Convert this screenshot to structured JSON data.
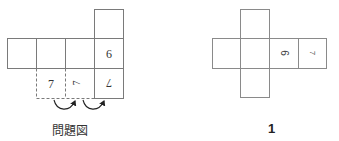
{
  "figures": {
    "problem": {
      "caption": "問題図",
      "cells": [
        {
          "id": "row-1",
          "x": 7,
          "y": 38,
          "label": ""
        },
        {
          "id": "row-2",
          "x": 36,
          "y": 38,
          "label": ""
        },
        {
          "id": "row-3",
          "x": 65,
          "y": 38,
          "label": ""
        },
        {
          "id": "row-4",
          "x": 94,
          "y": 38,
          "label": "6",
          "rotation": 0
        },
        {
          "id": "top",
          "x": 94,
          "y": 9,
          "label": ""
        },
        {
          "id": "bottom-solid",
          "x": 94,
          "y": 68,
          "label": "7",
          "rotation": 180
        }
      ],
      "dashed_cells": [
        {
          "id": "dashed-1",
          "x": 36,
          "y": 68,
          "label": "7",
          "rotation": 0
        },
        {
          "id": "dashed-2",
          "x": 65,
          "y": 68,
          "label": "7",
          "rotation": -90
        }
      ],
      "arrows": [
        {
          "from": "dashed-1",
          "to": "dashed-2"
        },
        {
          "from": "dashed-2",
          "to": "bottom-solid"
        }
      ]
    },
    "option1": {
      "caption": "1",
      "cells": [
        {
          "id": "top",
          "x": 240,
          "y": 9,
          "label": ""
        },
        {
          "id": "row-1",
          "x": 212,
          "y": 38,
          "label": ""
        },
        {
          "id": "row-2",
          "x": 240,
          "y": 38,
          "label": ""
        },
        {
          "id": "row-3",
          "x": 270,
          "y": 38,
          "label": "6",
          "rotation": 90
        },
        {
          "id": "row-4",
          "x": 298,
          "y": 38,
          "label": "7",
          "rotation": 90
        },
        {
          "id": "bottom",
          "x": 240,
          "y": 68,
          "label": ""
        }
      ]
    }
  },
  "colors": {
    "line": "#7a7a7a",
    "text": "#333333"
  }
}
